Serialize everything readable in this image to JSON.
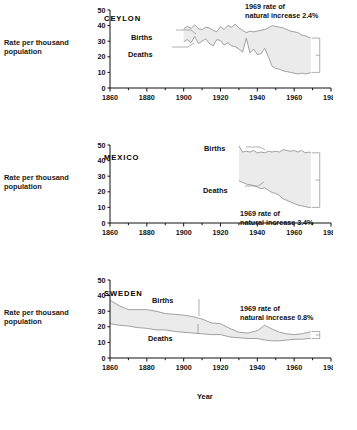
{
  "figure": {
    "y_axis_label_line1": "Rate per thousand",
    "y_axis_label_line2": "population",
    "x_axis_label": "Year",
    "births_label": "Births",
    "deaths_label": "Deaths",
    "fill_color": "#ebebeb",
    "line_color": "#8c8c8c",
    "axis_color": "#111111"
  },
  "chart_data": [
    {
      "type": "area",
      "title": "CEYLON",
      "xlabel": "Year",
      "ylabel": "Rate per thousand population",
      "xlim": [
        1860,
        1980
      ],
      "ylim": [
        0,
        50
      ],
      "yticks": [
        0,
        10,
        20,
        30,
        40,
        50
      ],
      "xticks": [
        1860,
        1880,
        1900,
        1920,
        1940,
        1960,
        1980
      ],
      "xminorstep": 10,
      "grid": false,
      "legend": "inline-labels",
      "annotation": "1969 rate of natural increase 2.4%",
      "annotation_line1": "1969 rate of",
      "annotation_line2": "natural increase 2.4%",
      "natural_increase_percent": 2.4,
      "series": [
        {
          "name": "Births",
          "x": [
            1900,
            1902,
            1904,
            1906,
            1908,
            1910,
            1912,
            1914,
            1916,
            1918,
            1920,
            1922,
            1924,
            1926,
            1928,
            1930,
            1932,
            1934,
            1936,
            1938,
            1940,
            1942,
            1944,
            1946,
            1948,
            1950,
            1952,
            1954,
            1956,
            1958,
            1960,
            1962,
            1964,
            1966,
            1968,
            1969
          ],
          "values": [
            38.0,
            39.5,
            38.2,
            40.5,
            38.0,
            37.5,
            39.0,
            38.5,
            37.0,
            36.0,
            39.5,
            37.5,
            40.0,
            39.0,
            41.0,
            38.5,
            37.0,
            35.5,
            36.5,
            36.0,
            36.5,
            37.0,
            37.5,
            38.5,
            40.0,
            39.5,
            39.0,
            38.5,
            37.5,
            36.5,
            36.0,
            35.5,
            34.0,
            33.5,
            32.5,
            32.0
          ]
        },
        {
          "name": "Deaths",
          "x": [
            1900,
            1902,
            1904,
            1906,
            1908,
            1910,
            1912,
            1914,
            1916,
            1918,
            1920,
            1922,
            1924,
            1926,
            1928,
            1930,
            1932,
            1934,
            1936,
            1938,
            1940,
            1942,
            1944,
            1946,
            1948,
            1950,
            1952,
            1954,
            1956,
            1958,
            1960,
            1962,
            1964,
            1966,
            1968,
            1969
          ],
          "values": [
            29.5,
            31.0,
            29.0,
            33.0,
            28.5,
            30.0,
            31.5,
            28.5,
            27.0,
            31.0,
            30.5,
            27.5,
            29.0,
            27.0,
            26.5,
            25.0,
            23.0,
            32.0,
            22.5,
            25.0,
            21.5,
            22.0,
            25.5,
            20.0,
            14.0,
            12.5,
            12.0,
            11.0,
            10.5,
            10.0,
            9.5,
            9.0,
            9.5,
            9.0,
            9.5,
            10.0
          ]
        }
      ]
    },
    {
      "type": "area",
      "title": "MEXICO",
      "xlabel": "Year",
      "ylabel": "Rate per thousand population",
      "xlim": [
        1860,
        1980
      ],
      "ylim": [
        0,
        50
      ],
      "yticks": [
        0,
        10,
        20,
        30,
        40,
        50
      ],
      "xticks": [
        1860,
        1880,
        1900,
        1920,
        1940,
        1960,
        1980
      ],
      "xminorstep": 10,
      "grid": false,
      "legend": "inline-labels",
      "annotation": "1969 rate of natural increase 3.4%",
      "annotation_line1": "1969 rate of",
      "annotation_line2": "natural increase 3.4%",
      "natural_increase_percent": 3.4,
      "series": [
        {
          "name": "Births",
          "x": [
            1930,
            1932,
            1934,
            1936,
            1938,
            1940,
            1942,
            1944,
            1946,
            1948,
            1950,
            1952,
            1954,
            1956,
            1958,
            1960,
            1962,
            1964,
            1966,
            1968,
            1969
          ],
          "values": [
            49.5,
            45.5,
            46.0,
            45.5,
            46.5,
            45.0,
            45.5,
            45.0,
            46.0,
            45.5,
            46.0,
            45.5,
            47.0,
            46.5,
            46.0,
            46.5,
            45.5,
            46.5,
            45.0,
            45.5,
            45.0
          ]
        },
        {
          "name": "Deaths",
          "x": [
            1930,
            1932,
            1934,
            1936,
            1938,
            1940,
            1942,
            1944,
            1946,
            1948,
            1950,
            1952,
            1954,
            1956,
            1958,
            1960,
            1962,
            1964,
            1966,
            1968,
            1969
          ],
          "values": [
            27.0,
            26.0,
            25.0,
            24.5,
            24.0,
            23.0,
            22.0,
            22.5,
            21.0,
            19.5,
            19.0,
            17.5,
            15.5,
            14.5,
            13.5,
            12.5,
            11.5,
            11.0,
            10.5,
            10.0,
            10.0
          ]
        }
      ]
    },
    {
      "type": "area",
      "title": "SWEDEN",
      "xlabel": "Year",
      "ylabel": "Rate per thousand population",
      "xlim": [
        1860,
        1980
      ],
      "ylim": [
        0,
        50
      ],
      "yticks": [
        0,
        10,
        20,
        30,
        40,
        50
      ],
      "xticks": [
        1860,
        1880,
        1900,
        1920,
        1940,
        1960,
        1980
      ],
      "xminorstep": 10,
      "grid": false,
      "legend": "inline-labels",
      "annotation": "1969 rate of natural increase 0.8%",
      "annotation_line1": "1969 rate of",
      "annotation_line2": "natural increase 0.8%",
      "natural_increase_percent": 0.8,
      "series": [
        {
          "name": "Births",
          "x": [
            1860,
            1865,
            1870,
            1875,
            1880,
            1885,
            1890,
            1895,
            1900,
            1905,
            1910,
            1915,
            1920,
            1925,
            1930,
            1935,
            1940,
            1944,
            1948,
            1952,
            1956,
            1960,
            1964,
            1968,
            1969
          ],
          "values": [
            37.0,
            33.5,
            31.0,
            31.0,
            31.0,
            30.0,
            28.5,
            28.0,
            27.5,
            26.5,
            25.0,
            22.5,
            22.0,
            19.0,
            16.5,
            16.0,
            17.5,
            21.0,
            18.5,
            16.5,
            15.5,
            15.0,
            15.5,
            16.5,
            17.0
          ]
        },
        {
          "name": "Deaths",
          "x": [
            1860,
            1865,
            1870,
            1875,
            1880,
            1885,
            1890,
            1895,
            1900,
            1905,
            1910,
            1915,
            1920,
            1925,
            1930,
            1935,
            1940,
            1944,
            1948,
            1952,
            1956,
            1960,
            1964,
            1968,
            1969
          ],
          "values": [
            22.0,
            21.0,
            20.5,
            19.5,
            19.0,
            18.0,
            18.0,
            17.0,
            16.5,
            16.0,
            15.5,
            15.0,
            15.0,
            13.5,
            13.0,
            12.5,
            12.5,
            11.5,
            11.0,
            11.0,
            11.5,
            12.0,
            12.0,
            12.5,
            12.5
          ]
        }
      ]
    }
  ]
}
